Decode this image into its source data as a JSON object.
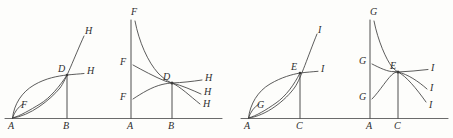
{
  "figure": {
    "type": "mathematical-diagram",
    "background_color": "#fdfdfb",
    "ink_color": "#3f3f3f",
    "panels": [
      {
        "id": "panel-1",
        "baseline_label_left": "A",
        "baseline_label_right": "B",
        "intersection_label": "D",
        "inner_label": "F",
        "branch_labels": [
          "H",
          "H"
        ]
      },
      {
        "id": "panel-2",
        "baseline_label_left": "A",
        "baseline_label_right": "B",
        "intersection_label": "D",
        "left_labels": [
          "F",
          "F",
          "F"
        ],
        "branch_labels": [
          "H",
          "H",
          "H"
        ]
      },
      {
        "id": "panel-3",
        "baseline_label_left": "A",
        "baseline_label_right": "C",
        "intersection_label": "E",
        "inner_label": "G",
        "branch_labels": [
          "I",
          "I"
        ]
      },
      {
        "id": "panel-4",
        "baseline_label_left": "A",
        "baseline_label_right": "C",
        "intersection_label": "E",
        "left_labels": [
          "G",
          "G",
          "G"
        ],
        "branch_labels": [
          "I",
          "I",
          "I"
        ]
      }
    ]
  },
  "labels": {
    "p1": {
      "A": "A",
      "B": "B",
      "D": "D",
      "F": "F",
      "H_upper": "H",
      "H_mid": "H"
    },
    "p2": {
      "A": "A",
      "B": "B",
      "D": "D",
      "F_top": "F",
      "F_mid": "F",
      "F_low": "F",
      "H_1": "H",
      "H_2": "H",
      "H_3": "H"
    },
    "p3": {
      "A": "A",
      "C": "C",
      "E": "E",
      "G": "G",
      "I_upper": "I",
      "I_mid": "I"
    },
    "p4": {
      "A": "A",
      "C": "C",
      "E": "E",
      "G_top": "G",
      "G_mid": "G",
      "G_low": "G",
      "I_1": "I",
      "I_2": "I",
      "I_3": "I"
    }
  }
}
